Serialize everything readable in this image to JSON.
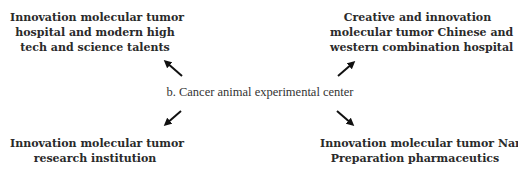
{
  "diagram": {
    "center": {
      "label": "b. Cancer animal experimental center"
    },
    "nodes": {
      "top_left": {
        "lines": [
          "Innovation molecular tumor",
          "hospital and modern high",
          "tech and science talents"
        ]
      },
      "top_right": {
        "lines": [
          "Creative and innovation",
          "molecular tumor Chinese and",
          "western combination hospital"
        ]
      },
      "bottom_left": {
        "lines": [
          "Innovation molecular tumor",
          "research institution"
        ]
      },
      "bottom_right": {
        "lines": [
          "Innovation molecular tumor Nami",
          "Preparation pharmaceutics"
        ]
      }
    },
    "arrows": [
      {
        "from": "center",
        "to": "top_left",
        "icon": "arrow-up-left"
      },
      {
        "from": "center",
        "to": "top_right",
        "icon": "arrow-up-right"
      },
      {
        "from": "center",
        "to": "bottom_left",
        "icon": "arrow-down-left"
      },
      {
        "from": "center",
        "to": "bottom_right",
        "icon": "arrow-down-right"
      }
    ],
    "colors": {
      "text": "#2a2a2a",
      "arrow": "#111111",
      "background": "#ffffff"
    }
  }
}
